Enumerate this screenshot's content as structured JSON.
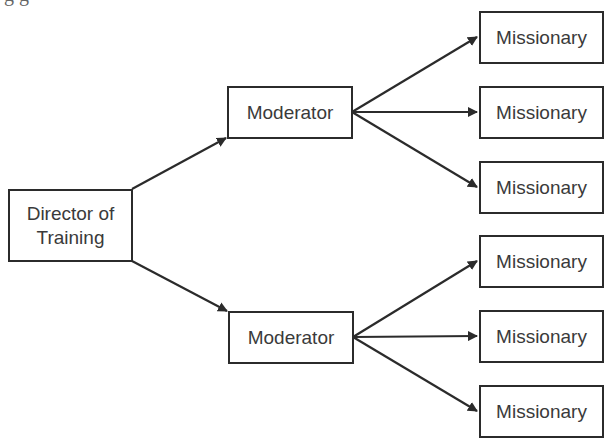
{
  "diagram": {
    "type": "hierarchy",
    "clipped_header_text": "g      g",
    "colors": {
      "stroke": "#2b2b2b",
      "text": "#3a3a3a",
      "background": "#ffffff"
    },
    "nodes": {
      "director": {
        "label_line1": "Director of",
        "label_line2": "Training"
      },
      "moderator_1": {
        "label": "Moderator"
      },
      "moderator_2": {
        "label": "Moderator"
      },
      "missionary_1": {
        "label": "Missionary"
      },
      "missionary_2": {
        "label": "Missionary"
      },
      "missionary_3": {
        "label": "Missionary"
      },
      "missionary_4": {
        "label": "Missionary"
      },
      "missionary_5": {
        "label": "Missionary"
      },
      "missionary_6": {
        "label": "Missionary"
      }
    },
    "edges": [
      {
        "from": "director",
        "to": "moderator_1"
      },
      {
        "from": "director",
        "to": "moderator_2"
      },
      {
        "from": "moderator_1",
        "to": "missionary_1"
      },
      {
        "from": "moderator_1",
        "to": "missionary_2"
      },
      {
        "from": "moderator_1",
        "to": "missionary_3"
      },
      {
        "from": "moderator_2",
        "to": "missionary_4"
      },
      {
        "from": "moderator_2",
        "to": "missionary_5"
      },
      {
        "from": "moderator_2",
        "to": "missionary_6"
      }
    ]
  }
}
